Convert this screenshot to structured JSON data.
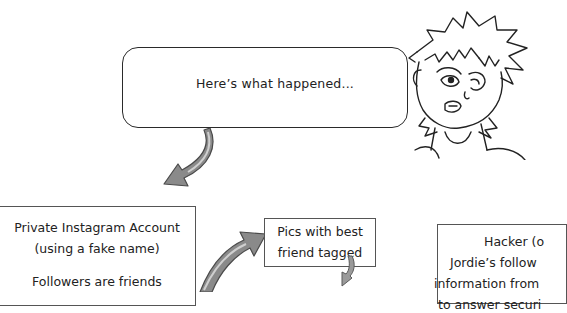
{
  "speech_bubble": {
    "text": "Here’s what happened..."
  },
  "boxes": {
    "account": {
      "line1": "Private Instagram Account",
      "line2": "(using a fake name)",
      "line3": "Followers are friends"
    },
    "pics": {
      "line1": "Pics with best",
      "line2": "friend tagged"
    },
    "hacker": {
      "line1": "Hacker (o",
      "line2": "Jordie’s follow",
      "line3": "information from",
      "line4": "to answer securi"
    }
  },
  "colors": {
    "arrow_fill": "#8a8a8a",
    "arrow_outline": "#4a4a4a",
    "line": "#2a2a2a"
  }
}
